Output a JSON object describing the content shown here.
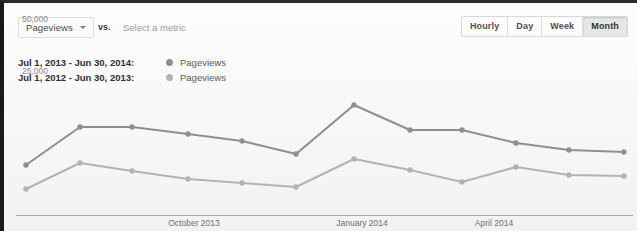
{
  "toolbar": {
    "metric_label": "Pageviews",
    "caret_icon": "chevron-down-icon",
    "vs_label": "vs.",
    "compare_placeholder": "Select a metric",
    "granularity": [
      {
        "label": "Hourly",
        "active": false
      },
      {
        "label": "Day",
        "active": false
      },
      {
        "label": "Week",
        "active": false
      },
      {
        "label": "Month",
        "active": true
      }
    ]
  },
  "legend": [
    {
      "range": "Jul 1, 2013 - Jun 30, 2014:",
      "metric": "Pageviews",
      "color": "#8f8f8f"
    },
    {
      "range": "Jul 1, 2012 - Jun 30, 2013:",
      "metric": "Pageviews",
      "color": "#b3b3b3"
    }
  ],
  "chart_data": {
    "type": "line",
    "title": "",
    "xlabel": "",
    "ylabel": "",
    "grid": false,
    "legend_position": "top-left",
    "ylim": [
      0,
      62500
    ],
    "ytick_labels": [
      "50,000",
      "25,000"
    ],
    "ytick_values": [
      50000,
      25000
    ],
    "xtick_labels": [
      "October 2013",
      "January 2014",
      "April 2014"
    ],
    "xtick_positions": [
      190,
      358,
      490
    ],
    "categories": [
      "Jul",
      "Aug",
      "Sep",
      "Oct",
      "Nov",
      "Dec",
      "Jan",
      "Feb",
      "Mar",
      "Apr",
      "May",
      "Jun"
    ],
    "series": [
      {
        "name": "Jul 1, 2013 - Jun 30, 2014",
        "color": "#8f8f8f",
        "values": [
          26000,
          43500,
          43700,
          41200,
          38500,
          33900,
          51800,
          39900,
          39900,
          35300,
          32900,
          32400
        ],
        "points": [
          [
            22,
            162
          ],
          [
            76,
            124
          ],
          [
            128,
            124
          ],
          [
            184,
            131
          ],
          [
            238,
            138
          ],
          [
            292,
            151
          ],
          [
            350,
            102
          ],
          [
            406,
            127
          ],
          [
            458,
            127
          ],
          [
            512,
            140
          ],
          [
            565,
            147
          ],
          [
            620,
            149
          ]
        ]
      },
      {
        "name": "Jul 1, 2012 - Jun 30, 2013",
        "color": "#b3b3b3",
        "values": [
          13500,
          27600,
          25400,
          23100,
          22100,
          21100,
          31500,
          25800,
          22600,
          26100,
          24200,
          24000
        ],
        "points": [
          [
            22,
            186
          ],
          [
            76,
            160
          ],
          [
            128,
            168
          ],
          [
            184,
            176
          ],
          [
            238,
            180
          ],
          [
            292,
            184
          ],
          [
            350,
            156
          ],
          [
            406,
            167
          ],
          [
            458,
            179
          ],
          [
            512,
            164
          ],
          [
            565,
            172
          ],
          [
            620,
            173
          ]
        ]
      }
    ]
  }
}
